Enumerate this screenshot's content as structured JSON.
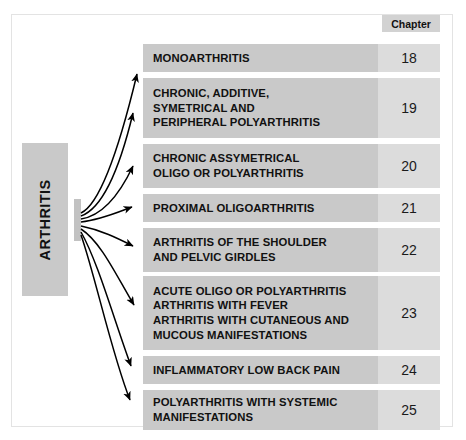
{
  "diagram": {
    "type": "flow-fan-out",
    "root": {
      "label": "ARTHRITIS",
      "orientation": "vertical"
    },
    "column_header": {
      "label": "Chapter"
    },
    "colors": {
      "row_fill": "#c9c9c9",
      "chapter_fill": "#dcdcdc",
      "header_fill": "#d2d2d2",
      "root_fill": "#c9c9c9",
      "text": "#111111",
      "frame_border": "#e3e3e3",
      "arrow": "#000000",
      "page_background": "#ffffff"
    },
    "rows": [
      {
        "chapter": "18",
        "lines": [
          "MONOARTHRITIS"
        ],
        "top": 44,
        "height": 28
      },
      {
        "chapter": "19",
        "lines": [
          "CHRONIC, ADDITIVE,",
          "SYMETRICAL AND",
          "PERIPHERAL POLYARTHRITIS"
        ],
        "top": 78,
        "height": 60
      },
      {
        "chapter": "20",
        "lines": [
          "CHRONIC ASSYMETRICAL",
          "OLIGO OR POLYARTHRITIS"
        ],
        "top": 144,
        "height": 44
      },
      {
        "chapter": "21",
        "lines": [
          "PROXIMAL OLIGOARTHRITIS"
        ],
        "top": 194,
        "height": 28
      },
      {
        "chapter": "22",
        "lines": [
          "ARTHRITIS OF THE SHOULDER",
          "AND PELVIC GIRDLES"
        ],
        "top": 228,
        "height": 44
      },
      {
        "chapter": "23",
        "lines": [
          "ACUTE OLIGO OR POLYARTHRITIS",
          "ARTHRITIS WITH FEVER",
          "ARTHRITIS WITH CUTANEOUS AND",
          "MUCOUS MANIFESTATIONS"
        ],
        "top": 276,
        "height": 74
      },
      {
        "chapter": "24",
        "lines": [
          "INFLAMMATORY LOW BACK PAIN"
        ],
        "top": 356,
        "height": 28
      },
      {
        "chapter": "25",
        "lines": [
          "POLYARTHRITIS WITH SYSTEMIC",
          "MANIFESTATIONS"
        ],
        "top": 390,
        "height": 40
      }
    ],
    "connectors": [
      {
        "from": "ARTHRITIS",
        "to_chapter": "18"
      },
      {
        "from": "ARTHRITIS",
        "to_chapter": "19"
      },
      {
        "from": "ARTHRITIS",
        "to_chapter": "20"
      },
      {
        "from": "ARTHRITIS",
        "to_chapter": "21"
      },
      {
        "from": "ARTHRITIS",
        "to_chapter": "22"
      },
      {
        "from": "ARTHRITIS",
        "to_chapter": "23"
      },
      {
        "from": "ARTHRITIS",
        "to_chapter": "24"
      },
      {
        "from": "ARTHRITIS",
        "to_chapter": "25"
      }
    ]
  }
}
